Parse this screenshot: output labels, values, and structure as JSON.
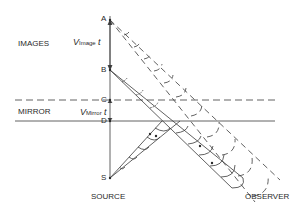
{
  "labels": {
    "images": "IMAGES",
    "mirror": "MIRROR",
    "source": "SOURCE",
    "observer": "OBSERVER",
    "v_image_v": "V",
    "v_image_sub": "Image",
    "v_image_t": "t",
    "v_mirror_v": "V",
    "v_mirror_sub": "Mirror",
    "v_mirror_t": "t"
  },
  "points": {
    "A": "A",
    "B": "B",
    "C": "C",
    "D": "D",
    "S": "S"
  },
  "colors": {
    "line": "#3a3a3a",
    "text": "#2a2a2a",
    "background": "#ffffff"
  }
}
